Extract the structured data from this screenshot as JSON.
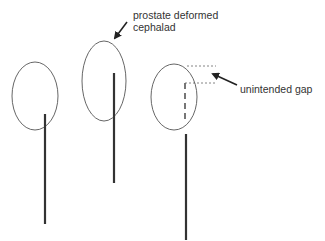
{
  "diagram": {
    "type": "needle-prostate-schematic",
    "colors": {
      "ellipse_stroke": "#555555",
      "needle": "#333333",
      "dash_line": "#666666",
      "arrow": "#222222",
      "text": "#333333",
      "background": "#ffffff"
    },
    "panels": [
      {
        "id": "panel-1",
        "ellipse": {
          "cx": 35,
          "cy": 96,
          "rx": 23,
          "ry": 34
        },
        "needle": {
          "x": 45,
          "y1": 114,
          "y2": 224
        }
      },
      {
        "id": "panel-2",
        "ellipse": {
          "cx": 104,
          "cy": 81,
          "rx": 22,
          "ry": 40
        },
        "needle": {
          "x": 114,
          "y1": 73,
          "y2": 183
        }
      },
      {
        "id": "panel-3",
        "ellipse": {
          "cx": 174,
          "cy": 97,
          "rx": 23,
          "ry": 33
        },
        "dashed_track": {
          "x": 185,
          "y1": 83,
          "y2": 122
        },
        "needle": {
          "x": 186,
          "y1": 134,
          "y2": 240
        },
        "gap_lines": [
          {
            "x1": 187,
            "x2": 216,
            "y": 66
          },
          {
            "x1": 185,
            "x2": 216,
            "y": 83
          }
        ]
      }
    ],
    "annotations": [
      {
        "id": "annotation-deformed",
        "lines": [
          "prostate deformed",
          "cephalad"
        ],
        "x": 133,
        "y": 19,
        "arrow": {
          "x1": 127,
          "y1": 22,
          "x2": 115,
          "y2": 38
        }
      },
      {
        "id": "annotation-gap",
        "lines": [
          "unintended gap"
        ],
        "x": 240,
        "y": 93,
        "arrow": {
          "x1": 237,
          "y1": 85,
          "x2": 213,
          "y2": 74
        }
      }
    ]
  }
}
